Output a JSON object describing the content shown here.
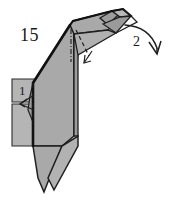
{
  "diagram": {
    "type": "origami-folding-step",
    "step_number": "15",
    "background_color": "#ffffff",
    "ink_color": "#1a1a1a",
    "shade_color": "#a9a9a9",
    "shade_color_light": "#bdbdbd",
    "shade_color_dark": "#8f8f8f",
    "labels": {
      "step": "15",
      "fold_one": "1",
      "fold_two": "2"
    },
    "annotations": [
      {
        "name": "step-number",
        "text": "15",
        "x": 20,
        "y": 26
      },
      {
        "name": "fold-order-1",
        "text": "1",
        "x": 19,
        "y": 84
      },
      {
        "name": "fold-order-2",
        "text": "2",
        "x": 133,
        "y": 35
      }
    ],
    "arrows": [
      {
        "name": "valley-fold-arrow-small",
        "direction": "down-left"
      },
      {
        "name": "mountain-fold-arrow-mid",
        "direction": "down-right"
      },
      {
        "name": "fold-arrow-large-curved",
        "direction": "curve-down-right"
      }
    ],
    "fold_lines": [
      {
        "name": "dash-dot-line-left",
        "style": "dash-dot"
      },
      {
        "name": "dash-dot-line-upper",
        "style": "dash-dot"
      },
      {
        "name": "dashed-line-diagonal",
        "style": "dashed"
      }
    ]
  }
}
